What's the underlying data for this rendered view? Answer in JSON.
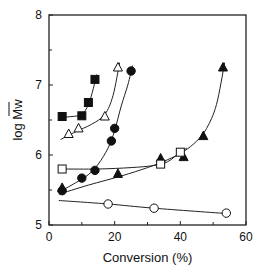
{
  "chart_data": {
    "type": "scatter",
    "title": "",
    "xlabel": "Conversion (%)",
    "ylabel": "log Mw",
    "ylabel_overbar": "Mw",
    "xlim": [
      0,
      60
    ],
    "ylim": [
      5,
      8
    ],
    "x_ticks": [
      0,
      20,
      40,
      60
    ],
    "x_minor_ticks": [
      10,
      30,
      50
    ],
    "y_ticks": [
      5,
      6,
      7,
      8
    ],
    "y_minor_ticks": [
      5.5,
      6.5,
      7.5
    ],
    "grid": false,
    "legend": null,
    "series": [
      {
        "name": "filled-squares",
        "marker": "square-filled",
        "x": [
          4,
          10,
          12,
          14
        ],
        "y": [
          6.55,
          6.56,
          6.75,
          7.08
        ],
        "fit_curve": [
          [
            4,
            6.54
          ],
          [
            7,
            6.55
          ],
          [
            10,
            6.58
          ],
          [
            12,
            6.72
          ],
          [
            13.5,
            6.95
          ],
          [
            14.5,
            7.15
          ]
        ]
      },
      {
        "name": "open-triangles",
        "marker": "triangle-open",
        "x": [
          6,
          9,
          17,
          21
        ],
        "y": [
          6.3,
          6.38,
          6.55,
          7.25
        ],
        "fit_curve": [
          [
            3.5,
            6.22
          ],
          [
            8,
            6.33
          ],
          [
            13,
            6.44
          ],
          [
            17,
            6.58
          ],
          [
            19.5,
            6.85
          ],
          [
            21.5,
            7.32
          ]
        ]
      },
      {
        "name": "filled-circles",
        "marker": "circle-filled",
        "x": [
          4,
          10,
          14,
          19,
          20,
          25
        ],
        "y": [
          5.49,
          5.67,
          5.78,
          6.2,
          6.38,
          7.2
        ],
        "fit_curve": [
          [
            3,
            5.47
          ],
          [
            8,
            5.6
          ],
          [
            12,
            5.72
          ],
          [
            15,
            5.87
          ],
          [
            18,
            6.1
          ],
          [
            20,
            6.35
          ],
          [
            22,
            6.7
          ],
          [
            24,
            7.0
          ],
          [
            25.5,
            7.28
          ]
        ]
      },
      {
        "name": "filled-triangles",
        "marker": "triangle-filled",
        "x": [
          4,
          21,
          34,
          41,
          47,
          53
        ],
        "y": [
          5.53,
          5.73,
          5.95,
          5.97,
          6.27,
          7.25
        ],
        "fit_curve": [
          [
            3,
            5.44
          ],
          [
            12,
            5.57
          ],
          [
            22,
            5.7
          ],
          [
            30,
            5.82
          ],
          [
            36,
            5.93
          ],
          [
            41,
            6.05
          ],
          [
            45,
            6.2
          ],
          [
            48,
            6.38
          ],
          [
            51,
            6.72
          ],
          [
            53.5,
            7.32
          ]
        ]
      },
      {
        "name": "open-squares",
        "marker": "square-open",
        "x": [
          4,
          34,
          40
        ],
        "y": [
          5.8,
          5.87,
          6.04
        ],
        "fit_curve": [
          [
            4,
            5.8
          ],
          [
            15,
            5.8
          ],
          [
            25,
            5.82
          ],
          [
            32,
            5.85
          ],
          [
            36,
            5.9
          ],
          [
            40,
            6.04
          ],
          [
            42,
            6.1
          ]
        ]
      },
      {
        "name": "open-circles",
        "marker": "circle-open",
        "x": [
          18,
          32,
          54
        ],
        "y": [
          5.3,
          5.24,
          5.17
        ],
        "fit_curve": [
          [
            3,
            5.35
          ],
          [
            18,
            5.3
          ],
          [
            32,
            5.24
          ],
          [
            55,
            5.16
          ]
        ]
      }
    ]
  },
  "colors": {
    "axis": "#222222",
    "marker": "#111111",
    "line": "#222222",
    "background": "#ffffff"
  }
}
